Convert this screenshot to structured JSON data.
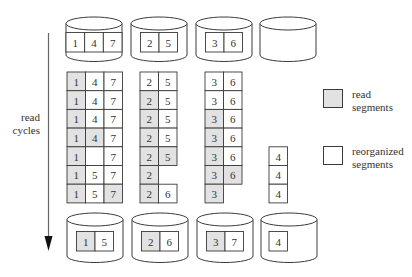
{
  "colors": {
    "read": "#e2e2e2",
    "reorganized": "#ffffff",
    "stroke": "#3a3a3a",
    "arrow": "#666666"
  },
  "axis_label": {
    "lines": [
      "read",
      "cycles"
    ]
  },
  "legend": [
    {
      "key": "read",
      "lines": [
        "read",
        "segments"
      ]
    },
    {
      "key": "reorganized",
      "lines": [
        "reorganized",
        "segments"
      ]
    }
  ],
  "top_disks": [
    {
      "cells": [
        {
          "v": "1",
          "read": false
        },
        {
          "v": "4",
          "read": false
        },
        {
          "v": "7",
          "read": false
        }
      ]
    },
    {
      "cells": [
        {
          "v": "2",
          "read": false
        },
        {
          "v": "5",
          "read": false
        }
      ]
    },
    {
      "cells": [
        {
          "v": "3",
          "read": false
        },
        {
          "v": "6",
          "read": false
        }
      ]
    },
    {
      "cells": []
    }
  ],
  "read_cycles": [
    {
      "disk": 1,
      "rows": [
        [
          {
            "v": "1",
            "read": true
          },
          {
            "v": "4",
            "read": false
          },
          {
            "v": "7",
            "read": false
          }
        ],
        [
          {
            "v": "1",
            "read": true
          },
          {
            "v": "4",
            "read": false
          },
          {
            "v": "7",
            "read": false
          }
        ],
        [
          {
            "v": "1",
            "read": true
          },
          {
            "v": "4",
            "read": false
          },
          {
            "v": "7",
            "read": false
          }
        ],
        [
          {
            "v": "1",
            "read": true
          },
          {
            "v": "4",
            "read": true
          },
          {
            "v": "7",
            "read": false
          }
        ],
        [
          {
            "v": "1",
            "read": true
          },
          {
            "v": "",
            "read": false
          },
          {
            "v": "7",
            "read": false
          }
        ],
        [
          {
            "v": "1",
            "read": true
          },
          {
            "v": "5",
            "read": false
          },
          {
            "v": "7",
            "read": false
          }
        ],
        [
          {
            "v": "1",
            "read": true
          },
          {
            "v": "5",
            "read": false
          },
          {
            "v": "7",
            "read": true
          }
        ]
      ]
    },
    {
      "disk": 2,
      "rows": [
        [
          {
            "v": "2",
            "read": false
          },
          {
            "v": "5",
            "read": false
          }
        ],
        [
          {
            "v": "2",
            "read": true
          },
          {
            "v": "5",
            "read": false
          }
        ],
        [
          {
            "v": "2",
            "read": true
          },
          {
            "v": "5",
            "read": false
          }
        ],
        [
          {
            "v": "2",
            "read": true
          },
          {
            "v": "5",
            "read": false
          }
        ],
        [
          {
            "v": "2",
            "read": true
          },
          {
            "v": "5",
            "read": true
          }
        ],
        [
          {
            "v": "2",
            "read": true
          }
        ],
        [
          {
            "v": "2",
            "read": true
          },
          {
            "v": "6",
            "read": false
          }
        ]
      ]
    },
    {
      "disk": 3,
      "rows": [
        [
          {
            "v": "3",
            "read": false
          },
          {
            "v": "6",
            "read": false
          }
        ],
        [
          {
            "v": "3",
            "read": false
          },
          {
            "v": "6",
            "read": false
          }
        ],
        [
          {
            "v": "3",
            "read": true
          },
          {
            "v": "6",
            "read": false
          }
        ],
        [
          {
            "v": "3",
            "read": true
          },
          {
            "v": "6",
            "read": false
          }
        ],
        [
          {
            "v": "3",
            "read": true
          },
          {
            "v": "6",
            "read": false
          }
        ],
        [
          {
            "v": "3",
            "read": true
          },
          {
            "v": "6",
            "read": true
          }
        ],
        [
          {
            "v": "3",
            "read": true
          }
        ]
      ]
    },
    {
      "disk": 4,
      "rows": [
        [],
        [],
        [],
        [],
        [
          {
            "v": "4",
            "read": false
          }
        ],
        [
          {
            "v": "4",
            "read": false
          }
        ],
        [
          {
            "v": "4",
            "read": false
          }
        ]
      ]
    }
  ],
  "bottom_disks": [
    {
      "cells": [
        {
          "v": "1",
          "read": true
        },
        {
          "v": "5",
          "read": false
        }
      ]
    },
    {
      "cells": [
        {
          "v": "2",
          "read": true
        },
        {
          "v": "6",
          "read": false
        }
      ]
    },
    {
      "cells": [
        {
          "v": "3",
          "read": true
        },
        {
          "v": "7",
          "read": false
        }
      ]
    },
    {
      "cells": [
        {
          "v": "4",
          "read": false
        }
      ]
    }
  ]
}
